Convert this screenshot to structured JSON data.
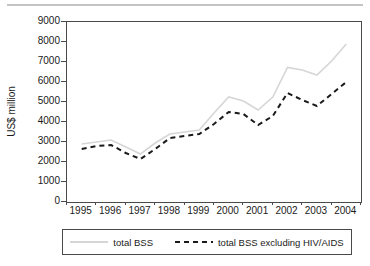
{
  "page": {
    "top_rule_color": "#c4c4c4",
    "axis_color": "#4a4a4a",
    "background": "#ffffff"
  },
  "chart": {
    "y_tick_labels": [
      "9000",
      "8000",
      "7000",
      "6000",
      "5000",
      "4000",
      "3000",
      "2000",
      "1000",
      "0"
    ],
    "x_tick_labels": [
      "1995",
      "1996",
      "1997",
      "1998",
      "1999",
      "2000",
      "2001",
      "2002",
      "2003",
      "2004"
    ]
  },
  "chart_data": {
    "type": "line",
    "title": "",
    "xlabel": "",
    "ylabel": "US$ million",
    "ylim": [
      0,
      9000
    ],
    "ytick_step": 1000,
    "grid": false,
    "legend_position": "bottom",
    "x": [
      1995,
      1995.5,
      1996,
      1996.5,
      1997,
      1997.5,
      1998,
      1998.5,
      1999,
      1999.5,
      2000,
      2000.5,
      2001,
      2001.5,
      2002,
      2002.5,
      2003,
      2003.5,
      2004
    ],
    "x_axis_labels": [
      "1995",
      "1996",
      "1997",
      "1998",
      "1999",
      "2000",
      "2001",
      "2002",
      "2003",
      "2004"
    ],
    "series": [
      {
        "name": "total BSS",
        "style": "solid",
        "color": "#d6d6d6",
        "stroke_width": 1.6,
        "values": [
          2900,
          3000,
          3100,
          2750,
          2400,
          2950,
          3400,
          3500,
          3600,
          4450,
          5250,
          5050,
          4600,
          5250,
          6725,
          6600,
          6350,
          7050,
          7900
        ]
      },
      {
        "name": "total BSS excluding HIV/AIDS",
        "style": "dashed",
        "color": "#1a1a1a",
        "stroke_width": 2,
        "values": [
          2650,
          2800,
          2850,
          2450,
          2150,
          2650,
          3200,
          3300,
          3400,
          3900,
          4500,
          4400,
          3850,
          4300,
          5450,
          5100,
          4800,
          5400,
          6000
        ]
      }
    ]
  }
}
